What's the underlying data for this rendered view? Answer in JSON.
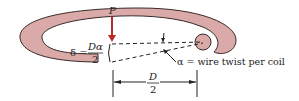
{
  "diagram": {
    "colors": {
      "coil_fill": "#d9aaa8",
      "coil_stroke": "#3a2a2a",
      "force_arrow": "#c0272d",
      "lines": "#222222"
    },
    "labels": {
      "force": "P",
      "delta_lhs": "δ =",
      "delta_num": "Dα",
      "delta_den": "2",
      "alpha_desc": "α = wire twist per coil",
      "dim_num": "D",
      "dim_den": "2"
    }
  }
}
